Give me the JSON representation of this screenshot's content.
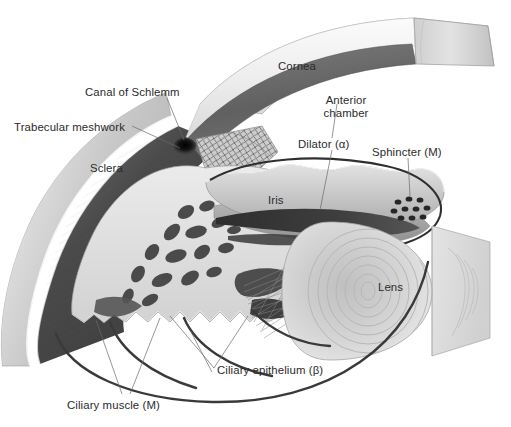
{
  "figure": {
    "type": "anatomical-cutaway-diagram",
    "background_color": "#ffffff",
    "label_color": "#2b2b2b",
    "leader_line_color": "#555555"
  },
  "labels": [
    {
      "id": "canal-of-schlemm",
      "text": "Canal of Schlemm",
      "x": 85,
      "y": 86,
      "align": "left"
    },
    {
      "id": "trabecular-meshwork",
      "text": "Trabecular meshwork",
      "x": 14,
      "y": 121,
      "align": "left"
    },
    {
      "id": "sclera",
      "text": "Sclera",
      "x": 90,
      "y": 162,
      "align": "left"
    },
    {
      "id": "cornea",
      "text": "Cornea",
      "x": 278,
      "y": 60,
      "align": "left"
    },
    {
      "id": "anterior-chamber",
      "text": "Anterior\nchamber",
      "x": 323,
      "y": 94,
      "align": "center"
    },
    {
      "id": "dilator",
      "text": "Dilator (α)",
      "x": 298,
      "y": 138,
      "align": "left"
    },
    {
      "id": "sphincter",
      "text": "Sphincter (M)",
      "x": 372,
      "y": 146,
      "align": "left"
    },
    {
      "id": "iris",
      "text": "Iris",
      "x": 268,
      "y": 194,
      "align": "left"
    },
    {
      "id": "lens",
      "text": "Lens",
      "x": 378,
      "y": 281,
      "align": "left"
    },
    {
      "id": "ciliary-epithelium",
      "text": "Ciliary epithelium (β)",
      "x": 217,
      "y": 364,
      "align": "left"
    },
    {
      "id": "ciliary-muscle",
      "text": "Ciliary muscle (M)",
      "x": 67,
      "y": 399,
      "align": "left"
    }
  ],
  "structures": [
    {
      "id": "cornea",
      "name": "Cornea",
      "description": "transparent dome, cut block end at upper right",
      "fill": "#e9e9e9"
    },
    {
      "id": "sclera",
      "name": "Sclera",
      "description": "outer light-grey fibrous coat, left crescent",
      "fill": "#d5d5d5"
    },
    {
      "id": "choroid",
      "name": "Choroid / uvea",
      "description": "dark inner band beneath sclera",
      "fill": "#4a4a4a"
    },
    {
      "id": "canal-of-schlemm",
      "name": "Canal of Schlemm",
      "description": "small dark oval at iridocorneal angle",
      "fill": "#1d1d1d"
    },
    {
      "id": "trabecular-meshwork",
      "name": "Trabecular meshwork",
      "description": "cross-hatched mesh wedge at the angle",
      "fill": "#9a9a9a"
    },
    {
      "id": "iris",
      "name": "Iris",
      "description": "wavy diaphragm spanning the chamber",
      "fill": "#c6c6c6"
    },
    {
      "id": "dilator",
      "name": "Dilator muscle",
      "description": "dark horizontal band in iris stroma",
      "fill": "#3c3c3c"
    },
    {
      "id": "sphincter",
      "name": "Sphincter muscle",
      "description": "cluster of dark dots at pupil margin",
      "fill": "#2a2a2a"
    },
    {
      "id": "ciliary-muscle",
      "name": "Ciliary muscle",
      "description": "dark irregular bundles in ciliary body",
      "fill": "#4a4a4a"
    },
    {
      "id": "ciliary-processes",
      "name": "Ciliary processes",
      "description": "scalloped pale ridges",
      "fill": "#e4e4e4"
    },
    {
      "id": "zonules",
      "name": "Zonular fibres",
      "description": "thin crossing suspensory threads to lens",
      "fill": "#8c8c8c"
    },
    {
      "id": "lens",
      "name": "Lens",
      "description": "concentric lamellar ellipse with cut face",
      "fill": "#cfcfcf"
    }
  ],
  "annotations": {
    "greek_alpha": "α",
    "greek_beta": "β",
    "receptor_M": "M"
  }
}
